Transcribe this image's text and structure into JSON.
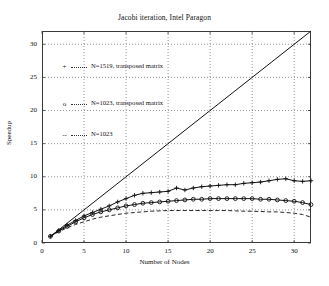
{
  "chart_data": {
    "type": "line",
    "title": "Jacobi iteration, Intel Paragon",
    "xlabel": "Number of Nodes",
    "ylabel": "Speedup",
    "xlim": [
      0,
      32
    ],
    "ylim": [
      0,
      32
    ],
    "xticks": [
      0,
      5,
      10,
      15,
      20,
      25,
      30
    ],
    "yticks": [
      0,
      5,
      10,
      15,
      20,
      25,
      30
    ],
    "grid": true,
    "grid_style": "dotted",
    "legend_position": "upper-left-inside",
    "series": [
      {
        "name": "ideal",
        "label": "",
        "marker": "none",
        "linestyle": "solid",
        "in_legend": false,
        "x": [
          1,
          32
        ],
        "y": [
          1,
          32
        ]
      },
      {
        "name": "N=1519, transposed matrix",
        "label": "N=1519, transposed matrix",
        "marker": "+",
        "linestyle": "solid",
        "in_legend": true,
        "x": [
          1,
          2,
          3,
          4,
          5,
          6,
          7,
          8,
          9,
          10,
          11,
          12,
          13,
          14,
          15,
          16,
          17,
          18,
          19,
          20,
          21,
          22,
          23,
          24,
          25,
          26,
          27,
          28,
          29,
          30,
          31,
          32
        ],
        "y": [
          1.0,
          1.9,
          2.7,
          3.4,
          4.1,
          4.6,
          5.1,
          5.6,
          6.2,
          6.7,
          7.2,
          7.5,
          7.6,
          7.7,
          7.8,
          8.3,
          8.0,
          8.3,
          8.5,
          8.6,
          8.7,
          8.8,
          8.8,
          9.0,
          9.1,
          9.2,
          9.4,
          9.6,
          9.7,
          9.4,
          9.3,
          9.4
        ]
      },
      {
        "name": "N=1023, transposed matrix",
        "label": "N=1023, transposed matrix",
        "marker": "o",
        "linestyle": "solid",
        "in_legend": true,
        "x": [
          1,
          2,
          3,
          4,
          5,
          6,
          7,
          8,
          9,
          10,
          11,
          12,
          13,
          14,
          15,
          16,
          17,
          18,
          19,
          20,
          21,
          22,
          23,
          24,
          25,
          26,
          27,
          28,
          29,
          30,
          31,
          32
        ],
        "y": [
          1.0,
          1.8,
          2.5,
          3.2,
          3.8,
          4.3,
          4.7,
          5.0,
          5.3,
          5.6,
          5.8,
          6.0,
          6.1,
          6.2,
          6.3,
          6.4,
          6.5,
          6.6,
          6.6,
          6.7,
          6.7,
          6.7,
          6.7,
          6.7,
          6.7,
          6.6,
          6.6,
          6.5,
          6.4,
          6.3,
          6.1,
          5.8
        ]
      },
      {
        "name": "N=1023",
        "label": "N=1023",
        "marker": "none",
        "linestyle": "dashed",
        "in_legend": true,
        "x": [
          1,
          2,
          3,
          4,
          5,
          6,
          7,
          8,
          9,
          10,
          11,
          12,
          13,
          14,
          15,
          16,
          17,
          18,
          19,
          20,
          21,
          22,
          23,
          24,
          25,
          26,
          27,
          28,
          29,
          30,
          31,
          32
        ],
        "y": [
          1.0,
          1.7,
          2.3,
          2.8,
          3.2,
          3.6,
          3.9,
          4.1,
          4.3,
          4.5,
          4.6,
          4.7,
          4.8,
          4.85,
          4.9,
          4.9,
          4.9,
          4.9,
          4.9,
          4.9,
          4.9,
          4.9,
          4.85,
          4.8,
          4.8,
          4.75,
          4.7,
          4.7,
          4.6,
          4.5,
          4.3,
          3.9
        ]
      }
    ]
  },
  "legend": {
    "entries": [
      {
        "symbol": "+",
        "label": "N=1519, transposed matrix"
      },
      {
        "symbol": "o",
        "label": "N=1023, transposed matrix"
      },
      {
        "symbol": "--",
        "label": "N=1023"
      }
    ]
  }
}
